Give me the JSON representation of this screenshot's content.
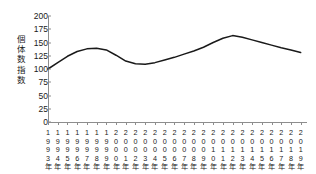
{
  "chart_data": {
    "type": "line",
    "title": "",
    "subtitle": "",
    "xlabel": "",
    "ylabel": "個体数指数",
    "ylim": [
      0,
      200
    ],
    "yticks": [
      0,
      25,
      50,
      75,
      100,
      125,
      150,
      175,
      200
    ],
    "grid": false,
    "legend": null,
    "categories": [
      "1993年",
      "1994年",
      "1995年",
      "1996年",
      "1997年",
      "1998年",
      "1999年",
      "2000年",
      "2001年",
      "2002年",
      "2003年",
      "2004年",
      "2005年",
      "2006年",
      "2007年",
      "2008年",
      "2009年",
      "2010年",
      "2011年",
      "2012年",
      "2013年",
      "2014年",
      "2015年",
      "2016年",
      "2017年",
      "2018年",
      "2019年"
    ],
    "x": [
      1993,
      1994,
      1995,
      1996,
      1997,
      1998,
      1999,
      2000,
      2001,
      2002,
      2003,
      2004,
      2005,
      2006,
      2007,
      2008,
      2009,
      2010,
      2011,
      2012,
      2013,
      2014,
      2015,
      2016,
      2017,
      2018,
      2019
    ],
    "values": [
      100,
      112,
      124,
      133,
      138,
      139,
      136,
      126,
      115,
      110,
      109,
      112,
      117,
      122,
      128,
      134,
      141,
      150,
      158,
      163,
      160,
      155,
      150,
      145,
      140,
      136,
      131
    ],
    "series": [
      {
        "name": "個体数指数",
        "color": "#1a1a1a",
        "values": [
          100,
          112,
          124,
          133,
          138,
          139,
          136,
          126,
          115,
          110,
          109,
          112,
          117,
          122,
          128,
          134,
          141,
          150,
          158,
          163,
          160,
          155,
          150,
          145,
          140,
          136,
          131
        ]
      }
    ]
  },
  "axis": {
    "y_title": "個体数指数",
    "y_title_chars": "個\n体\n数\n指\n数",
    "line_color": "#8d8d8d",
    "text_color": "#1a1a1a"
  }
}
